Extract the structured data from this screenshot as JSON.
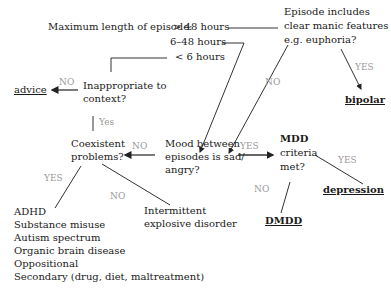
{
  "diagram": {
    "type": "flowchart",
    "nodes": {
      "episode_length": {
        "label": "Maximum length of episode:",
        "options": [
          "> 48 hours",
          "6–48 hours",
          "< 6  hours"
        ]
      },
      "manic_features": {
        "lines": [
          "Episode includes",
          "clear manic features",
          "e.g. euphoria?"
        ]
      },
      "inappropriate": {
        "lines": [
          "Inappropriate to",
          "context?"
        ]
      },
      "mood_between": {
        "lines": [
          "Mood between",
          "episodes is sad/",
          "angry?"
        ]
      },
      "coexistent": {
        "lines": [
          "Coexistent",
          "problems?"
        ]
      },
      "mdd_criteria": {
        "lines": [
          "MDD",
          "criteria",
          "met?"
        ]
      },
      "intermittent": {
        "lines": [
          "Intermittent",
          "explosive disorder"
        ]
      },
      "comorbid_list": [
        "ADHD",
        "Substance misuse",
        "Autism spectrum",
        "Organic brain disease",
        "Oppositional",
        "Secondary (drug, diet, maltreatment)"
      ]
    },
    "outcomes": {
      "advice": "advice",
      "bipolar": "bipolar",
      "depression": "depression",
      "dmdd": "DMDD"
    },
    "edge_labels": {
      "inappropriate_no": "NO",
      "inappropriate_yes": "Yes",
      "manic_yes": "YES",
      "manic_no": "NO",
      "mood_no": "NO",
      "mood_yes": "YES",
      "coexistent_yes": "YES",
      "coexistent_no": "NO",
      "mdd_yes": "YES",
      "mdd_no": "NO"
    },
    "colors": {
      "text": "#1a1a1a",
      "edge_label": "#9a9a9a",
      "line": "#222222",
      "background": "#ffffff"
    }
  }
}
